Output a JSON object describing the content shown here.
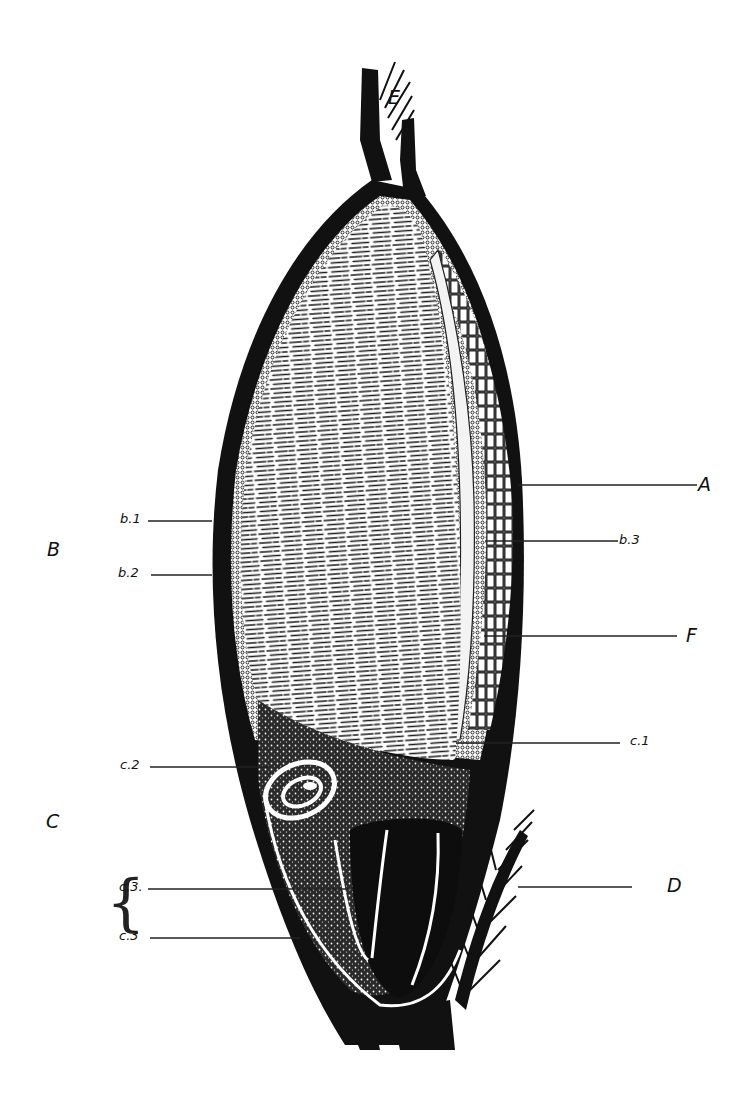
{
  "figure": {
    "style": "black-and-white engraved botanical illustration",
    "ink_color": "#111111",
    "background": "#ffffff"
  },
  "labels": {
    "A": "A",
    "B": "B",
    "C": "C",
    "D": "D",
    "E": "E",
    "F": "F",
    "b1": "b.1",
    "b2": "b.2",
    "b3": "b.3",
    "c1": "c.1",
    "c2": "c.2",
    "c3a": "c.3.",
    "c3b": "c.3"
  },
  "leaders": [
    {
      "label": "A",
      "side": "right",
      "y": 485
    },
    {
      "label": "b.3",
      "side": "right",
      "y": 541
    },
    {
      "label": "F",
      "side": "right",
      "y": 636
    },
    {
      "label": "c.1",
      "side": "right",
      "y": 743
    },
    {
      "label": "D",
      "side": "right",
      "y": 887
    },
    {
      "label": "b.1",
      "side": "left",
      "y": 521
    },
    {
      "label": "b.2",
      "side": "left",
      "y": 575
    },
    {
      "label": "c.2",
      "side": "left",
      "y": 767
    },
    {
      "label": "c.3.",
      "side": "left",
      "y": 889
    },
    {
      "label": "c.3",
      "side": "left",
      "y": 938
    }
  ]
}
